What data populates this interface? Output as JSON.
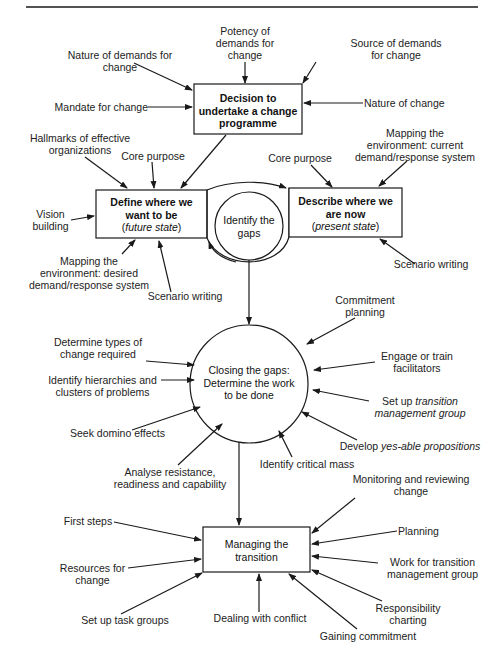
{
  "nodes": {
    "decision": {
      "line1": "Decision to",
      "line2": "undertake a change",
      "line3": "programme"
    },
    "define": {
      "line1": "Define where we",
      "line2": "want to be",
      "open": "(",
      "italic": "future state",
      "close": ")"
    },
    "identify": {
      "line1": "Identify the",
      "line2": "gaps"
    },
    "describe": {
      "line1": "Describe where we",
      "line2": "are now",
      "open": "(",
      "italic": "present state",
      "close": ")"
    },
    "closing": {
      "line1": "Closing the gaps:",
      "line2": "Determine the work",
      "line3": "to be done"
    },
    "managing": {
      "line1": "Managing the",
      "line2": "transition"
    }
  },
  "decision_inputs": [
    {
      "line1": "Potency of",
      "line2": "demands for",
      "line3": "change"
    },
    {
      "line1": "Nature of demands for",
      "line2": "change"
    },
    {
      "line1": "Source of demands",
      "line2": "for change"
    },
    {
      "line1": "Mandate for change"
    },
    {
      "line1": "Nature of change"
    }
  ],
  "define_inputs": [
    {
      "line1": "Hallmarks of effective",
      "line2": "organizations"
    },
    {
      "line1": "Core purpose"
    },
    {
      "line1": "Vision",
      "line2": "building"
    },
    {
      "line1": "Mapping the",
      "line2": "environment: desired",
      "line3": "demand/response system"
    },
    {
      "line1": "Scenario writing"
    }
  ],
  "describe_inputs": [
    {
      "line1": "Core purpose"
    },
    {
      "line1": "Mapping the",
      "line2": "environment: current",
      "line3": "demand/response system"
    },
    {
      "line1": "Scenario writing"
    }
  ],
  "closing_inputs": [
    {
      "line1": "Commitment",
      "line2": "planning"
    },
    {
      "line1": "Determine types of",
      "line2": "change required"
    },
    {
      "line1": "Engage or train",
      "line2": "facilitators"
    },
    {
      "line1": "Identify hierarchies and",
      "line2": "clusters of problems"
    },
    {
      "prefix": "Set up ",
      "italic1": "transition",
      "italic2": "management group"
    },
    {
      "line1": "Seek domino effects"
    },
    {
      "prefix": "Develop ",
      "italic1": "yes-able propositions"
    },
    {
      "line1": "Analyse resistance,",
      "line2": "readiness and capability"
    },
    {
      "line1": "Identify critical mass"
    }
  ],
  "managing_inputs": [
    {
      "line1": "Monitoring and reviewing",
      "line2": "change"
    },
    {
      "line1": "First steps"
    },
    {
      "line1": "Planning"
    },
    {
      "line1": "Resources for",
      "line2": "change"
    },
    {
      "line1": "Work for transition",
      "line2": "management group"
    },
    {
      "line1": "Responsibility",
      "line2": "charting"
    },
    {
      "line1": "Set up task groups"
    },
    {
      "line1": "Dealing with conflict"
    },
    {
      "line1": "Gaining commitment"
    }
  ]
}
